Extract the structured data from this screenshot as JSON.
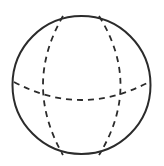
{
  "diagram": {
    "type": "sphere-wireframe",
    "background": "#ffffff",
    "stroke_color": "#2b2b2b",
    "outline": {
      "cx": 81.5,
      "cy": 85,
      "r": 69,
      "stroke_width": 2
    },
    "dashed_lines": [
      {
        "name": "equator",
        "d": "M 14 82 Q 81.5 118 149 82"
      },
      {
        "name": "left-meridian",
        "d": "M 63 16 Q 23 85 63 155"
      },
      {
        "name": "right-meridian",
        "d": "M 99 16 Q 142 85 99 155"
      }
    ],
    "dash_pattern": "6 5",
    "dash_width": 1.8
  }
}
